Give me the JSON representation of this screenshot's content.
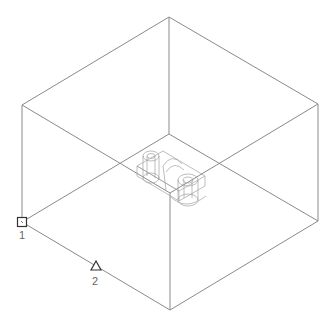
{
  "view": {
    "type": "isometric-wireframe",
    "line_color": "#8a8a8a",
    "part_color": "#a0a0a0",
    "marker_color": "#333333"
  },
  "box": {
    "vertices": {
      "top": [
        169,
        17
      ],
      "left_top": [
        22,
        105
      ],
      "right_top": [
        318,
        104
      ],
      "back_inner": [
        169,
        134
      ],
      "front_inner": [
        170,
        193
      ],
      "left_bottom": [
        22,
        222
      ],
      "right_bottom": [
        318,
        221
      ],
      "bottom": [
        170,
        310
      ]
    }
  },
  "markers": [
    {
      "id": "1",
      "shape": "square",
      "label": "1",
      "x": 22,
      "y": 222
    },
    {
      "id": "2",
      "shape": "triangle",
      "label": "2",
      "x": 96,
      "y": 266
    }
  ]
}
